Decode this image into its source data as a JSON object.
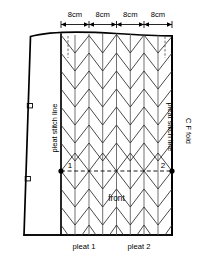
{
  "diagram": {
    "background_color": "#ffffff",
    "line_color": "#000000"
  },
  "dimensions": {
    "labels": [
      "8cm",
      "8cm",
      "8cm",
      "8cm"
    ],
    "count": 4
  },
  "labels": {
    "left_stitch_line": "pleat stitch line",
    "right_stitch_line": "pleat stitch line",
    "cf_fold": "C F fold",
    "front": "front",
    "pleat_1": "pleat 1",
    "pleat_2": "pleat 2",
    "point_1": "1",
    "point_2": "2"
  }
}
